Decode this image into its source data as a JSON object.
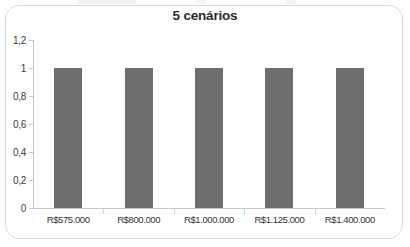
{
  "card": {
    "accent_color": "#6e6e6e",
    "border_color": "#d9dadc",
    "axis_color": "#c7c8ca"
  },
  "chart_data": {
    "type": "bar",
    "title": "5 cenários",
    "xlabel": "",
    "ylabel": "",
    "categories": [
      "R$575.000",
      "R$800.000",
      "R$1.000.000",
      "R$1.125.000",
      "R$1.400.000"
    ],
    "values": [
      1,
      1,
      1,
      1,
      1
    ],
    "ylim": [
      0,
      1.2
    ],
    "ytick_labels": [
      "1,2",
      "1",
      "0,8",
      "0,6",
      "0,4",
      "0,2",
      "0"
    ],
    "ytick_values": [
      1.2,
      1,
      0.8,
      0.6,
      0.4,
      0.2,
      0
    ],
    "grid": false,
    "legend": false,
    "bar_color": "#6e6e6e"
  }
}
